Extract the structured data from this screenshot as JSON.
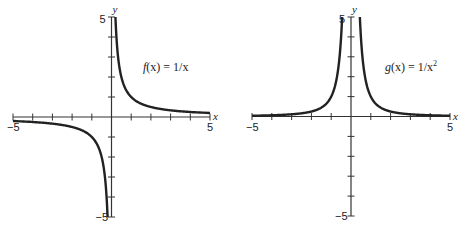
{
  "chart_data": [
    {
      "type": "line",
      "title": "f(x) = 1/x",
      "label_func": "f",
      "label_rest": "(x) = 1/x",
      "xlabel": "x",
      "ylabel": "y",
      "xlim": [
        -5,
        5
      ],
      "ylim": [
        -5,
        5
      ],
      "xticks": [
        -5,
        -4,
        -3,
        -2,
        -1,
        0,
        1,
        2,
        3,
        4,
        5
      ],
      "yticks": [
        -5,
        -4,
        -3,
        -2,
        -1,
        0,
        1,
        2,
        3,
        4,
        5
      ],
      "xtick_labels": {
        "min": "−5",
        "max": "5"
      },
      "ytick_labels": {
        "min": "−5",
        "max": "5"
      },
      "grid": false,
      "series": [
        {
          "name": "f(x) = 1/x",
          "x": [
            -5,
            -4,
            -3,
            -2,
            -1,
            -0.5,
            -0.3,
            -0.2
          ],
          "y": [
            -0.2,
            -0.25,
            -0.333,
            -0.5,
            -1,
            -2,
            -3.333,
            -5
          ]
        },
        {
          "name": "f(x) = 1/x",
          "x": [
            0.2,
            0.3,
            0.5,
            1,
            2,
            3,
            4,
            5
          ],
          "y": [
            5,
            3.333,
            2,
            1,
            0.5,
            0.333,
            0.25,
            0.2
          ]
        }
      ]
    },
    {
      "type": "line",
      "title": "g(x) = 1/x²",
      "label_func": "g",
      "label_rest": "(x) = 1/x",
      "label_sup": "2",
      "xlabel": "x",
      "ylabel": "y",
      "xlim": [
        -5,
        5
      ],
      "ylim": [
        -5,
        5
      ],
      "xticks": [
        -5,
        -4,
        -3,
        -2,
        -1,
        0,
        1,
        2,
        3,
        4,
        5
      ],
      "yticks": [
        -5,
        -4,
        -3,
        -2,
        -1,
        0,
        1,
        2,
        3,
        4,
        5
      ],
      "xtick_labels": {
        "min": "−5",
        "max": "5"
      },
      "ytick_labels": {
        "min": "−5",
        "max": "5"
      },
      "grid": false,
      "series": [
        {
          "name": "g(x) = 1/x²",
          "x": [
            -5,
            -4,
            -3,
            -2,
            -1,
            -0.7,
            -0.5,
            -0.447
          ],
          "y": [
            0.04,
            0.0625,
            0.111,
            0.25,
            1,
            2.04,
            4,
            5
          ]
        },
        {
          "name": "g(x) = 1/x²",
          "x": [
            0.447,
            0.5,
            0.7,
            1,
            2,
            3,
            4,
            5
          ],
          "y": [
            5,
            4,
            2.04,
            1,
            0.25,
            0.111,
            0.0625,
            0.04
          ]
        }
      ]
    }
  ]
}
